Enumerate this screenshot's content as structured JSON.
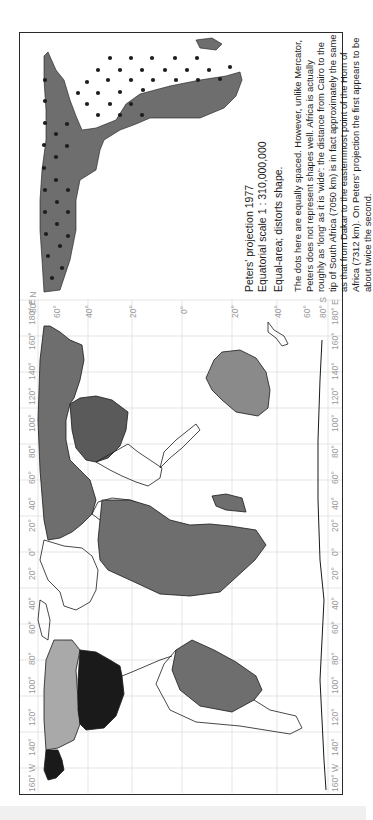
{
  "page": {
    "header_fragment": "...(cropped heading text)...",
    "frame": {
      "border_color": "#2a2a2a"
    }
  },
  "caption": {
    "title_line1": "Peters' projection 1977",
    "title_line2": "Equatorial scale 1 : 310,000,000",
    "property": "Equal-area; distorts shape.",
    "body": "The dots here are equally spaced. However, unlike Mercator, Peters does not represent shapes well. Africa is actually roughly as 'long' as it is 'wide': the distance from Cairo to the tip of South Africa (7050 km) is in fact approximately the same as that from Dakar to the easternmost point of the Horn of Africa (7312 km). On Peters' projection the first appears to be about twice the second."
  },
  "inset": {
    "subject": "Africa with equally spaced dots",
    "fill_color": "#6e6e6e",
    "dot_color": "#1e1e1e"
  },
  "map": {
    "projection": "Peters",
    "longitude_labels": [
      "160° W",
      "140°",
      "120°",
      "100°",
      "80°",
      "60°",
      "40°",
      "20°",
      "0°",
      "20°",
      "40°",
      "60°",
      "80°",
      "100°",
      "120°",
      "140°",
      "160°",
      "180° E"
    ],
    "latitude_labels_top": [
      "80° N",
      "60°",
      "40°",
      "20°",
      "0°",
      "20°",
      "40°",
      "60°",
      "80° S"
    ],
    "colors": {
      "dark_gray": "#6e6e6e",
      "black": "#1a1a1a",
      "light_gray": "#a9a9a9",
      "grid": "#dcdcdc",
      "outline": "#1a1a1a"
    },
    "regions": [
      {
        "name": "Asia/Europe (Russia)",
        "fill": "dark_gray"
      },
      {
        "name": "China",
        "fill": "dark_gray"
      },
      {
        "name": "Africa",
        "fill": "dark_gray"
      },
      {
        "name": "Australia",
        "fill": "light_gray"
      },
      {
        "name": "South America",
        "fill": "dark_gray"
      },
      {
        "name": "Canada",
        "fill": "light_gray"
      },
      {
        "name": "USA",
        "fill": "black"
      },
      {
        "name": "Alaska",
        "fill": "black"
      },
      {
        "name": "Antarctica",
        "fill": "none"
      }
    ]
  }
}
